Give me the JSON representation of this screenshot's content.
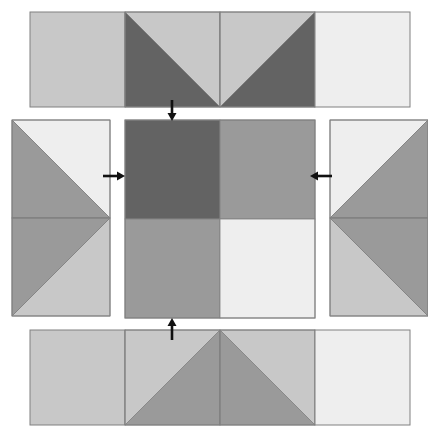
{
  "diagram": {
    "type": "quilt-block-assembly",
    "canvas": {
      "width": 428,
      "height": 443,
      "background": "#ffffff"
    },
    "palette": {
      "dark": "#636363",
      "medium": "#9a9a9a",
      "light": "#c8c8c8",
      "white": "#eeeeee",
      "outline": "#808080",
      "arrow": "#111111"
    },
    "labels": {
      "top_row": "top-row-strip",
      "left_column": "left-column-strip",
      "center": "center-four-patch",
      "right_column": "right-column-strip",
      "bottom_row": "bottom-row-strip"
    },
    "rows": {
      "top_strip": {
        "name": "top-row-strip",
        "x": 30,
        "y": 12,
        "unit_size": 95,
        "unit_count": 4,
        "units": [
          {
            "name": "top-unit-1",
            "kind": "solid",
            "fill": "light"
          },
          {
            "name": "top-unit-2",
            "kind": "hst",
            "orientation": "tl-br",
            "fill_a": "light",
            "fill_b": "dark"
          },
          {
            "name": "top-unit-3",
            "kind": "hst",
            "orientation": "tr-bl",
            "fill_a": "light",
            "fill_b": "dark"
          },
          {
            "name": "top-unit-4",
            "kind": "solid",
            "fill": "white"
          }
        ]
      },
      "bottom_strip": {
        "name": "bottom-row-strip",
        "x": 30,
        "y": 330,
        "unit_size": 95,
        "unit_count": 4,
        "units": [
          {
            "name": "bottom-unit-1",
            "kind": "solid",
            "fill": "light"
          },
          {
            "name": "bottom-unit-2",
            "kind": "hst",
            "orientation": "bl-tr",
            "fill_a": "medium",
            "fill_b": "light"
          },
          {
            "name": "bottom-unit-3",
            "kind": "hst",
            "orientation": "br-tl",
            "fill_a": "medium",
            "fill_b": "light"
          },
          {
            "name": "bottom-unit-4",
            "kind": "solid",
            "fill": "white"
          }
        ]
      },
      "left_strip": {
        "name": "left-column-strip",
        "x": 12,
        "y": 120,
        "unit_size": 98,
        "unit_count": 2,
        "units": [
          {
            "name": "left-unit-1",
            "kind": "hst",
            "orientation": "tl-br",
            "fill_a": "white",
            "fill_b": "medium"
          },
          {
            "name": "left-unit-2",
            "kind": "hst",
            "orientation": "bl-tr",
            "fill_a": "light",
            "fill_b": "medium"
          }
        ]
      },
      "right_strip": {
        "name": "right-column-strip",
        "x": 330,
        "y": 120,
        "unit_size": 98,
        "unit_count": 2,
        "units": [
          {
            "name": "right-unit-1",
            "kind": "hst",
            "orientation": "tr-bl",
            "fill_a": "white",
            "fill_b": "medium"
          },
          {
            "name": "right-unit-2",
            "kind": "hst",
            "orientation": "br-tl",
            "fill_a": "light",
            "fill_b": "medium"
          }
        ]
      },
      "center_block": {
        "name": "center-four-patch",
        "x": 125,
        "y": 120,
        "width": 190,
        "height": 198,
        "quadrants": [
          {
            "name": "center-quadrant-top-left",
            "fill": "dark"
          },
          {
            "name": "center-quadrant-top-right",
            "fill": "medium"
          },
          {
            "name": "center-quadrant-bottom-left",
            "fill": "medium"
          },
          {
            "name": "center-quadrant-bottom-right",
            "fill": "white"
          }
        ]
      }
    },
    "arrows": [
      {
        "name": "arrow-down-top-to-center",
        "direction": "down",
        "x": 172,
        "y": 100,
        "length": 21
      },
      {
        "name": "arrow-right-left-to-center",
        "direction": "right",
        "x": 103,
        "y": 176,
        "length": 22
      },
      {
        "name": "arrow-left-right-to-center",
        "direction": "left",
        "x": 310,
        "y": 176,
        "length": 22
      },
      {
        "name": "arrow-up-bottom-to-center",
        "direction": "up",
        "x": 172,
        "y": 318,
        "length": 22
      }
    ]
  }
}
